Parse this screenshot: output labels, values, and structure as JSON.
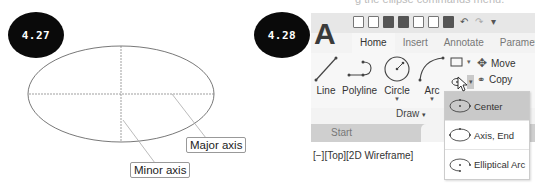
{
  "top_fragment": "g the ellipse commands menu.",
  "figures": {
    "fig_427": {
      "badge": "4.27",
      "callouts": {
        "major": "Major axis",
        "minor": "Minor axis"
      }
    },
    "fig_428": {
      "badge": "4.28",
      "app_logo": "A",
      "quick_access_icons": [
        "new-icon",
        "open-icon",
        "save-icon",
        "save-as-icon",
        "publish-icon",
        "plot-icon",
        "print-icon",
        "undo-icon",
        "redo-icon",
        "customize-icon"
      ],
      "tabs": [
        {
          "label": "Home",
          "active": true
        },
        {
          "label": "Insert",
          "active": false
        },
        {
          "label": "Annotate",
          "active": false
        },
        {
          "label": "Parametric",
          "active": false
        }
      ],
      "tools": {
        "line": "Line",
        "polyline": "Polyline",
        "circle": "Circle",
        "arc": "Arc",
        "move": "Move",
        "copy": "Copy"
      },
      "panel_title": "Draw",
      "panel_caret": "▾",
      "file_tabs": {
        "start": "Start",
        "drawing": "Draw"
      },
      "viewport_label": "[−][Top][2D Wireframe]",
      "ellipse_menu": [
        {
          "label": "Center",
          "active": true
        },
        {
          "label": "Axis, End",
          "active": false
        },
        {
          "label": "Elliptical Arc",
          "active": false
        }
      ],
      "colors": {
        "ribbon_bg": "#f7f7f7",
        "qat_bg": "#e7e7e7",
        "menu_active_bg": "#c9c9c9",
        "file_tab_bar": "#cfcfcf"
      }
    }
  }
}
